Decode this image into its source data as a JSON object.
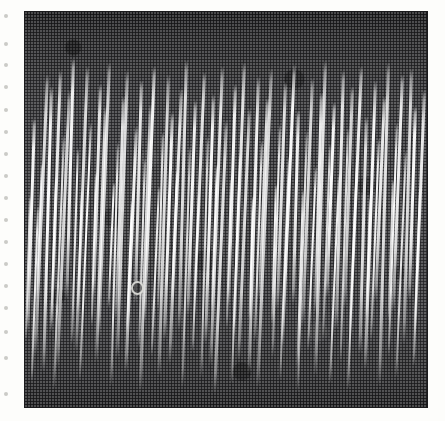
{
  "figure": {
    "kind": "halftone-photograph",
    "caption": ""
  },
  "page": {
    "background_color": "#fdfdfb",
    "width": 445,
    "height": 421
  },
  "plate": {
    "x": 25,
    "y": 12,
    "width": 402,
    "height": 395,
    "background_color": "#3c3c3f",
    "border_color": "#1b1b1d",
    "top_band_color": "#1f1f21",
    "bottom_band_color": "#232325",
    "trace_color": "#ffffff"
  },
  "blemish": {
    "name": "emulsion-ring-blemish",
    "x": 131,
    "y": 281,
    "label": "o"
  },
  "edge_marks": {
    "count": 17,
    "color": "#b9b9b4",
    "ys": [
      14,
      42,
      63,
      85,
      108,
      130,
      152,
      174,
      196,
      218,
      240,
      262,
      284,
      306,
      330,
      356,
      392
    ]
  },
  "chart_data": {
    "type": "line",
    "title": "",
    "subtitle": "",
    "xlabel": "",
    "ylabel": "",
    "grid": false,
    "legend": null,
    "axis_visible": false,
    "tick_labels": [],
    "annotations": [
      {
        "text": "o",
        "x": 131,
        "y": 281,
        "note": "circular emulsion blemish on plate"
      }
    ],
    "xlim": [
      25,
      427
    ],
    "ylim": [
      12,
      407
    ],
    "series": [
      {
        "name": "oscillograph-strokes",
        "fields": [
          "x",
          "top",
          "bottom",
          "width"
        ],
        "values": [
          [
            29,
            196,
            340,
            2.2
          ],
          [
            33,
            118,
            330,
            2.6
          ],
          [
            37,
            206,
            382,
            2.4
          ],
          [
            41,
            163,
            300,
            1.8
          ],
          [
            46,
            74,
            356,
            3.0
          ],
          [
            50,
            86,
            372,
            2.8
          ],
          [
            55,
            176,
            332,
            2.0
          ],
          [
            59,
            70,
            324,
            2.6
          ],
          [
            63,
            134,
            390,
            2.4
          ],
          [
            68,
            90,
            368,
            2.8
          ],
          [
            72,
            58,
            300,
            3.0
          ],
          [
            77,
            148,
            344,
            2.2
          ],
          [
            81,
            190,
            314,
            1.8
          ],
          [
            86,
            66,
            352,
            2.8
          ],
          [
            90,
            122,
            380,
            2.4
          ],
          [
            95,
            172,
            326,
            2.0
          ],
          [
            99,
            84,
            296,
            2.6
          ],
          [
            104,
            106,
            362,
            2.6
          ],
          [
            108,
            62,
            338,
            2.9
          ],
          [
            113,
            182,
            308,
            1.9
          ],
          [
            117,
            142,
            386,
            2.4
          ],
          [
            122,
            96,
            318,
            2.6
          ],
          [
            126,
            70,
            358,
            2.8
          ],
          [
            131,
            200,
            334,
            2.0
          ],
          [
            135,
            126,
            372,
            2.5
          ],
          [
            140,
            80,
            304,
            2.7
          ],
          [
            144,
            158,
            348,
            2.2
          ],
          [
            149,
            104,
            392,
            2.5
          ],
          [
            153,
            66,
            322,
            2.9
          ],
          [
            158,
            186,
            356,
            2.0
          ],
          [
            162,
            132,
            310,
            2.3
          ],
          [
            167,
            74,
            376,
            2.8
          ],
          [
            171,
            112,
            340,
            2.5
          ],
          [
            176,
            170,
            298,
            1.9
          ],
          [
            180,
            88,
            364,
            2.7
          ],
          [
            185,
            60,
            330,
            3.0
          ],
          [
            189,
            146,
            388,
            2.4
          ],
          [
            194,
            100,
            316,
            2.5
          ],
          [
            198,
            192,
            352,
            2.0
          ],
          [
            203,
            72,
            302,
            2.8
          ],
          [
            207,
            136,
            378,
            2.4
          ],
          [
            212,
            94,
            344,
            2.6
          ],
          [
            216,
            164,
            312,
            2.0
          ],
          [
            221,
            66,
            366,
            2.9
          ],
          [
            225,
            120,
            394,
            2.5
          ],
          [
            230,
            178,
            328,
            1.9
          ],
          [
            234,
            84,
            306,
            2.7
          ],
          [
            239,
            152,
            384,
            2.3
          ],
          [
            243,
            62,
            336,
            2.9
          ],
          [
            248,
            108,
            360,
            2.5
          ],
          [
            252,
            196,
            320,
            1.8
          ],
          [
            257,
            76,
            374,
            2.8
          ],
          [
            261,
            140,
            342,
            2.3
          ],
          [
            266,
            98,
            300,
            2.6
          ],
          [
            270,
            68,
            388,
            2.9
          ],
          [
            275,
            184,
            324,
            1.9
          ],
          [
            279,
            124,
            358,
            2.4
          ],
          [
            284,
            82,
            310,
            2.7
          ],
          [
            288,
            156,
            380,
            2.2
          ],
          [
            293,
            64,
            346,
            2.9
          ],
          [
            297,
            110,
            304,
            2.5
          ],
          [
            302,
            190,
            368,
            1.9
          ],
          [
            306,
            130,
            392,
            2.4
          ],
          [
            311,
            78,
            326,
            2.8
          ],
          [
            315,
            166,
            350,
            2.0
          ],
          [
            320,
            92,
            314,
            2.6
          ],
          [
            324,
            60,
            376,
            3.0
          ],
          [
            329,
            144,
            338,
            2.3
          ],
          [
            333,
            102,
            298,
            2.6
          ],
          [
            338,
            174,
            384,
            2.0
          ],
          [
            342,
            70,
            330,
            2.8
          ],
          [
            347,
            128,
            362,
            2.4
          ],
          [
            351,
            86,
            308,
            2.7
          ],
          [
            356,
            160,
            390,
            2.1
          ],
          [
            360,
            66,
            334,
            2.9
          ],
          [
            365,
            116,
            354,
            2.5
          ],
          [
            369,
            198,
            318,
            1.8
          ],
          [
            374,
            80,
            370,
            2.7
          ],
          [
            378,
            138,
            340,
            2.3
          ],
          [
            383,
            96,
            302,
            2.6
          ],
          [
            387,
            62,
            386,
            2.9
          ],
          [
            392,
            180,
            322,
            1.9
          ],
          [
            396,
            122,
            356,
            2.4
          ],
          [
            401,
            74,
            312,
            2.8
          ],
          [
            405,
            150,
            378,
            2.2
          ],
          [
            410,
            68,
            344,
            2.9
          ],
          [
            414,
            106,
            300,
            2.5
          ],
          [
            419,
            188,
            366,
            1.9
          ],
          [
            423,
            90,
            332,
            2.6
          ]
        ]
      }
    ]
  }
}
